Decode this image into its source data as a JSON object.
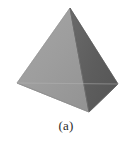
{
  "figure": {
    "name": "tetrahedron",
    "caption": "(a)",
    "background_color": "#ffffff",
    "outline_color": "#6f6f6f",
    "vertices": {
      "apex": [
        70,
        8
      ],
      "left": [
        17,
        83
      ],
      "right": [
        118,
        84
      ],
      "front": [
        89,
        112
      ]
    },
    "faces": [
      {
        "name": "left-face",
        "points": "70,8 17,83 89,112",
        "fill": "#9d9d9d",
        "shade": "mid-gray"
      },
      {
        "name": "right-face",
        "points": "70,8 118,84 89,112",
        "fill": "#5e5e5e",
        "shade": "dark-gray"
      },
      {
        "name": "bottom-front-face",
        "points": "17,83 118,84 89,112",
        "fill": "#b9b9b9",
        "shade": "light-gray"
      }
    ],
    "edges": [
      {
        "name": "edge-apex-left",
        "x1": 70,
        "y1": 8,
        "x2": 17,
        "y2": 83
      },
      {
        "name": "edge-apex-right",
        "x1": 70,
        "y1": 8,
        "x2": 118,
        "y2": 84
      },
      {
        "name": "edge-apex-front",
        "x1": 70,
        "y1": 8,
        "x2": 89,
        "y2": 112
      },
      {
        "name": "edge-left-front",
        "x1": 17,
        "y1": 83,
        "x2": 89,
        "y2": 112
      },
      {
        "name": "edge-right-front",
        "x1": 118,
        "y1": 84,
        "x2": 89,
        "y2": 112
      },
      {
        "name": "edge-left-right",
        "x1": 17,
        "y1": 83,
        "x2": 118,
        "y2": 84
      }
    ]
  }
}
